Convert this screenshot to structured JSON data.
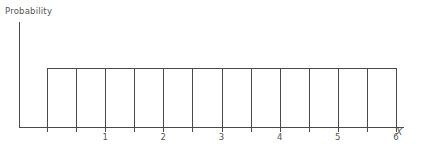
{
  "chart_data": {
    "type": "bar",
    "title": "",
    "subtitle": "",
    "xlabel": "X",
    "ylabel": "Probability",
    "grid": false,
    "legend": "none",
    "annotations": [],
    "categories": [
      "0.5",
      "1",
      "1.5",
      "2",
      "2.5",
      "3",
      "3.5",
      "4",
      "4.5",
      "5",
      "5.5",
      "6"
    ],
    "values": [
      1,
      1,
      1,
      1,
      1,
      1,
      1,
      1,
      1,
      1,
      1,
      1
    ],
    "bar_count": 12,
    "xlim": [
      0,
      6.5
    ],
    "ylim": [
      0,
      1.25
    ],
    "x_tick_labels": [
      "1",
      "2",
      "3",
      "4",
      "5",
      "6"
    ],
    "x_tick_values": [
      1,
      2,
      3,
      4,
      5,
      6
    ],
    "y_tick_labels": []
  },
  "axes": {
    "y_axis_label": "Probability",
    "x_axis_label": "X"
  },
  "style": {
    "line_color": "#4a4a4a",
    "text_color": "#555555",
    "background": "#ffffff",
    "bar_fill": "none"
  },
  "geometry": {
    "y_axis_x": 19,
    "y_axis_top": 22,
    "baseline_y": 127,
    "bars_left": 47,
    "bars_right": 396,
    "bars_top": 68,
    "axis_right": 404,
    "tick_length": 5
  }
}
